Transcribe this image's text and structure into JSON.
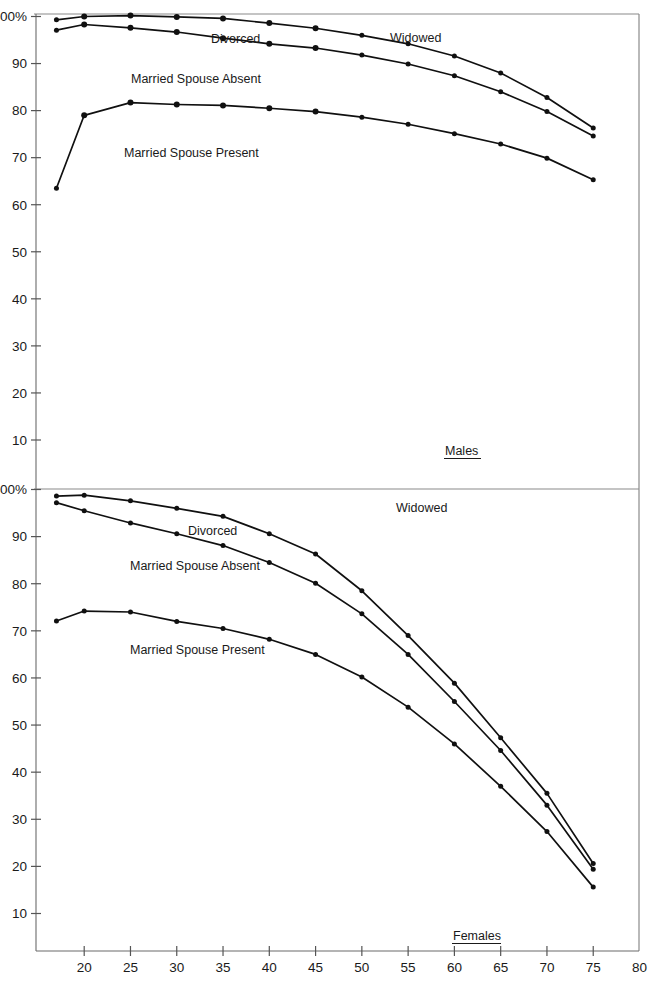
{
  "chart_data": [
    {
      "type": "line",
      "title": "Males",
      "panel_label": "Males",
      "xlabel": "",
      "ylabel": "",
      "xlim": [
        16,
        80
      ],
      "ylim": [
        0,
        103
      ],
      "grid": false,
      "legend": "inline-annotations",
      "x": [
        17,
        20,
        25,
        30,
        35,
        40,
        45,
        50,
        55,
        60,
        65,
        70,
        75
      ],
      "xticks": [
        20,
        25,
        30,
        35,
        40,
        45,
        50,
        55,
        60,
        65,
        70,
        75,
        80
      ],
      "xtick_labels": [
        "20",
        "25",
        "30",
        "35",
        "40",
        "45",
        "50",
        "55",
        "60",
        "65",
        "70",
        "75",
        "80"
      ],
      "yticks": [
        10,
        20,
        30,
        40,
        50,
        60,
        70,
        80,
        90,
        100
      ],
      "ytick_labels": [
        "10",
        "20",
        "30",
        "40",
        "50",
        "60",
        "70",
        "80",
        "90",
        "100%"
      ],
      "series": [
        {
          "name": "Widowed",
          "label_position": "upper-right",
          "values": [
            99.3,
            100.0,
            100.2,
            99.9,
            99.6,
            98.6,
            97.5,
            96.0,
            94.2,
            91.6,
            88.0,
            82.8,
            76.3,
            63.9
          ]
        },
        {
          "name": "Divorced",
          "label_position": "upper-center",
          "values": [
            97.1,
            98.3,
            97.6,
            96.7,
            95.4,
            94.2,
            93.3,
            91.8,
            89.9,
            87.4,
            84.0,
            79.8,
            74.6,
            62.2
          ]
        },
        {
          "name": "Married Spouse Present",
          "label_position": "lower-left",
          "values": [
            63.5,
            79.0,
            81.7,
            81.3,
            81.1,
            80.5,
            79.8,
            78.6,
            77.1,
            75.1,
            72.9,
            69.9,
            65.3,
            53.6
          ]
        }
      ],
      "annotations": [
        "Widowed",
        "Divorced",
        "Married Spouse Absent",
        "Married Spouse Present"
      ]
    },
    {
      "type": "line",
      "title": "Females",
      "panel_label": "Females",
      "xlabel": "",
      "ylabel": "",
      "xlim": [
        16,
        80
      ],
      "ylim": [
        0,
        103
      ],
      "grid": false,
      "legend": "inline-annotations",
      "x": [
        17,
        20,
        25,
        30,
        35,
        40,
        45,
        50,
        55,
        60,
        65,
        70,
        75
      ],
      "xticks": [
        20,
        25,
        30,
        35,
        40,
        45,
        50,
        55,
        60,
        65,
        70,
        75,
        80
      ],
      "xtick_labels": [
        "20",
        "25",
        "30",
        "35",
        "40",
        "45",
        "50",
        "55",
        "60",
        "65",
        "70",
        "75",
        "80"
      ],
      "yticks": [
        10,
        20,
        30,
        40,
        50,
        60,
        70,
        80,
        90,
        100
      ],
      "ytick_labels": [
        "10",
        "20",
        "30",
        "40",
        "50",
        "60",
        "70",
        "80",
        "90",
        "100%"
      ],
      "series": [
        {
          "name": "Widowed",
          "label_position": "upper-right",
          "values": [
            98.6,
            98.8,
            97.6,
            96.0,
            94.3,
            90.6,
            86.3,
            78.5,
            69.0,
            58.9,
            47.3,
            35.5,
            20.6
          ]
        },
        {
          "name": "Divorced",
          "label_position": "upper-center",
          "values": [
            97.2,
            95.5,
            92.9,
            90.6,
            88.1,
            84.5,
            80.1,
            73.6,
            65.0,
            55.0,
            44.6,
            33.0,
            19.4
          ]
        },
        {
          "name": "Married Spouse Present",
          "label_position": "lower-left",
          "values": [
            72.1,
            74.2,
            74.0,
            72.0,
            70.5,
            68.2,
            65.0,
            60.2,
            53.8,
            46.0,
            37.0,
            27.4,
            15.6
          ]
        }
      ],
      "annotations": [
        "Widowed",
        "Divorced",
        "Married Spouse Absent",
        "Married Spouse Present"
      ]
    }
  ],
  "panels": {
    "males": {
      "label": "Males",
      "annotations": {
        "widowed": "Widowed",
        "divorced": "Divorced",
        "married_spouse_absent": "Married Spouse Absent",
        "married_spouse_present": "Married Spouse Present"
      },
      "ytick_labels": [
        "100%",
        "90",
        "80",
        "70",
        "60",
        "50",
        "40",
        "30",
        "20",
        "10"
      ]
    },
    "females": {
      "label": "Females",
      "annotations": {
        "widowed": "Widowed",
        "divorced": "Divorced",
        "married_spouse_absent": "Married Spouse Absent",
        "married_spouse_present": "Married Spouse Present"
      },
      "ytick_labels": [
        "100%",
        "90",
        "80",
        "70",
        "60",
        "50",
        "40",
        "30",
        "20",
        "10"
      ]
    }
  },
  "xaxis": {
    "tick_labels": [
      "20",
      "25",
      "30",
      "35",
      "40",
      "45",
      "50",
      "55",
      "60",
      "65",
      "70",
      "75",
      "80"
    ]
  },
  "colors": {
    "line": "#101010",
    "frame": "#8a8a8a",
    "text": "#1a1a1a"
  }
}
